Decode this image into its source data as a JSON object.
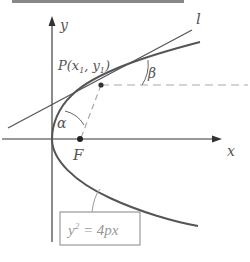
{
  "header": {
    "text": ""
  },
  "diagram": {
    "axes": {
      "x_label": "x",
      "y_label": "y"
    },
    "point_P": {
      "label": "P(x",
      "sub1": "1",
      "sep": ", y",
      "sub2": "1",
      "close": ")"
    },
    "focus": {
      "label": "F"
    },
    "tangent_line": {
      "label": "l"
    },
    "angles": {
      "alpha": "α",
      "beta": "β"
    },
    "equation": {
      "base": "y",
      "exp": "2",
      "rest": " = 4px"
    }
  },
  "colors": {
    "curve": "#555555",
    "axis": "#666666",
    "dashed": "#aaaaaa",
    "box": "#999999",
    "text": "#555555"
  }
}
